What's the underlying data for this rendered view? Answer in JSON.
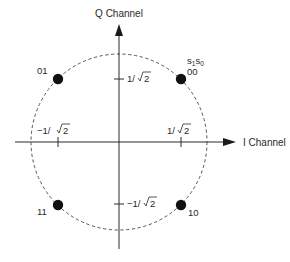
{
  "diagram": {
    "colors": {
      "background": "#ffffff",
      "axis": "#2b2b2b",
      "circle": "#555555",
      "point": "#111111",
      "text": "#2a2a2a"
    },
    "axes": {
      "vertical": {
        "label": "Q Channel"
      },
      "horizontal": {
        "label": "I Channel"
      }
    },
    "ticks": {
      "i_negative": {
        "text": "−1/",
        "radicand": "2"
      },
      "i_positive": {
        "text": "1/",
        "radicand": "2"
      },
      "q_positive": {
        "text": "1/",
        "radicand": "2"
      },
      "q_negative": {
        "text": "−1/",
        "radicand": "2"
      }
    },
    "legend": {
      "bits_header_s": "s",
      "bits_header_sub1": "1",
      "bits_header_s2": "s",
      "bits_header_sub0": "0"
    },
    "points": [
      {
        "name": "point-00",
        "label": "00",
        "quadrant": "I+ Q+"
      },
      {
        "name": "point-01",
        "label": "01",
        "quadrant": "I- Q+"
      },
      {
        "name": "point-11",
        "label": "11",
        "quadrant": "I- Q-"
      },
      {
        "name": "point-10",
        "label": "10",
        "quadrant": "I+ Q-"
      }
    ]
  }
}
